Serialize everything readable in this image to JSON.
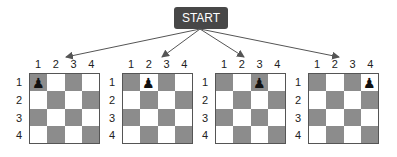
{
  "start": {
    "label": "START"
  },
  "colors": {
    "dark_square": "#8c8c8c",
    "light_square": "#ffffff",
    "start_box": "#474747",
    "arrow": "#555555"
  },
  "column_labels": [
    "1",
    "2",
    "3",
    "4"
  ],
  "row_labels": [
    "1",
    "2",
    "3",
    "4"
  ],
  "piece": {
    "name": "pawn",
    "glyph": "♟"
  },
  "boards": [
    {
      "left": 29,
      "piece_row": 1,
      "piece_col": 1
    },
    {
      "left": 122,
      "piece_row": 1,
      "piece_col": 2
    },
    {
      "left": 215,
      "piece_row": 1,
      "piece_col": 3
    },
    {
      "left": 308,
      "piece_row": 1,
      "piece_col": 4
    }
  ],
  "arrows": [
    {
      "from": [
        200,
        29
      ],
      "to": [
        66,
        57
      ]
    },
    {
      "from": [
        200,
        29
      ],
      "to": [
        162,
        57
      ]
    },
    {
      "from": [
        200,
        29
      ],
      "to": [
        244,
        57
      ]
    },
    {
      "from": [
        200,
        29
      ],
      "to": [
        339,
        57
      ]
    }
  ]
}
